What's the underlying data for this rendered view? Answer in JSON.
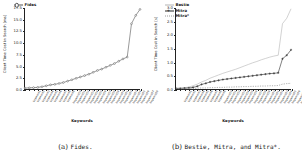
{
  "figure": {
    "subfigures": [
      {
        "caption_tag": "(a)",
        "caption_text": "Fides.",
        "chart_data": {
          "type": "line",
          "title": "",
          "xlabel": "Keywords",
          "ylabel": "Client Time Cost in Search [ms]",
          "ylim": [
            0.0,
            17.5
          ],
          "yticks": [
            "0.0",
            "2.5",
            "5.0",
            "7.5",
            "10.0",
            "12.5",
            "15.0",
            "17.5"
          ],
          "ytick_values": [
            0.0,
            2.5,
            5.0,
            7.5,
            10.0,
            12.5,
            15.0,
            17.5
          ],
          "grid": false,
          "legend_position": "upper left",
          "categories": [
            "keyword1",
            "keyword2",
            "keyword3",
            "keyword4",
            "keyword5",
            "keyword6",
            "keyword7",
            "keyword8",
            "keyword9",
            "keyword10",
            "keyword11",
            "keyword12",
            "keyword13",
            "keyword14",
            "keyword15",
            "keyword16",
            "keyword17",
            "keyword18",
            "keyword19",
            "keyword20",
            "keyword21",
            "keyword22",
            "keyword23",
            "keyword24",
            "keyword25",
            "keyword26",
            "keyword27",
            "keyword28"
          ],
          "series": [
            {
              "name": "Fides",
              "color": "#555555",
              "marker": "circle",
              "linestyle": "solid",
              "values": [
                0.2,
                0.25,
                0.3,
                0.35,
                0.5,
                0.7,
                0.9,
                1.0,
                1.2,
                1.4,
                1.7,
                2.0,
                2.3,
                2.6,
                2.9,
                3.2,
                3.6,
                4.0,
                4.3,
                4.7,
                5.1,
                5.5,
                6.0,
                6.5,
                6.9,
                14.1,
                15.9,
                17.2
              ]
            }
          ]
        }
      },
      {
        "caption_tag": "(b)",
        "caption_text": "Bestie, Mitra, and Mitra*.",
        "chart_data": {
          "type": "line",
          "title": "",
          "xlabel": "Keywords",
          "ylabel": "Client Time Cost in Search [s]",
          "ylim": [
            0.0,
            3.0
          ],
          "yticks": [
            "0.0",
            "0.5",
            "1.0",
            "1.5",
            "2.0",
            "2.5",
            "3.0"
          ],
          "ytick_values": [
            0.0,
            0.5,
            1.0,
            1.5,
            2.0,
            2.5,
            3.0
          ],
          "grid": false,
          "legend_position": "upper left",
          "categories": [
            "keyword1",
            "keyword2",
            "keyword3",
            "keyword4",
            "keyword5",
            "keyword6",
            "keyword7",
            "keyword8",
            "keyword9",
            "keyword10",
            "keyword11",
            "keyword12",
            "keyword13",
            "keyword14",
            "keyword15",
            "keyword16",
            "keyword17",
            "keyword18",
            "keyword19",
            "keyword20",
            "keyword21",
            "keyword22",
            "keyword23",
            "keyword24",
            "keyword25",
            "keyword26",
            "keyword27",
            "keyword28"
          ],
          "series": [
            {
              "name": "Bestie",
              "color": "#b4b4b4",
              "marker": "none",
              "linestyle": "solid",
              "values": [
                0.03,
                0.04,
                0.05,
                0.07,
                0.12,
                0.18,
                0.26,
                0.32,
                0.4,
                0.46,
                0.52,
                0.58,
                0.63,
                0.68,
                0.73,
                0.79,
                0.85,
                0.91,
                0.97,
                1.02,
                1.08,
                1.13,
                1.18,
                1.22,
                1.25,
                2.42,
                2.62,
                2.97
              ]
            },
            {
              "name": "Mitra",
              "color": "#2b2b2b",
              "marker": "plus",
              "linestyle": "solid",
              "values": [
                0.02,
                0.02,
                0.03,
                0.04,
                0.06,
                0.1,
                0.17,
                0.21,
                0.26,
                0.29,
                0.32,
                0.35,
                0.37,
                0.39,
                0.41,
                0.43,
                0.45,
                0.47,
                0.49,
                0.51,
                0.53,
                0.55,
                0.57,
                0.58,
                0.6,
                1.12,
                1.25,
                1.45
              ]
            },
            {
              "name": "Mitra*",
              "color": "#9a9a9a",
              "marker": "none",
              "linestyle": "dotted",
              "values": [
                0.01,
                0.01,
                0.01,
                0.02,
                0.02,
                0.03,
                0.04,
                0.04,
                0.05,
                0.05,
                0.06,
                0.06,
                0.07,
                0.07,
                0.08,
                0.08,
                0.09,
                0.09,
                0.1,
                0.1,
                0.11,
                0.11,
                0.12,
                0.12,
                0.13,
                0.18,
                0.2,
                0.21
              ]
            }
          ]
        }
      }
    ]
  }
}
